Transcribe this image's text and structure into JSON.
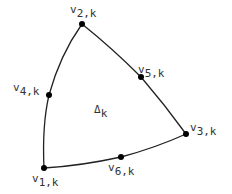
{
  "diagram": {
    "colors": {
      "stroke": "#222222",
      "text": "#333333",
      "background": "#ffffff"
    },
    "element_label": {
      "main": "Δ",
      "sub": "k"
    },
    "vertices": [
      {
        "id": "v1",
        "main": "v",
        "sub": "1,k",
        "x": 44,
        "y": 168
      },
      {
        "id": "v2",
        "main": "v",
        "sub": "2,k",
        "x": 82,
        "y": 24
      },
      {
        "id": "v3",
        "main": "v",
        "sub": "3,k",
        "x": 186,
        "y": 134
      },
      {
        "id": "v4",
        "main": "v",
        "sub": "4,k",
        "x": 49,
        "y": 95
      },
      {
        "id": "v5",
        "main": "v",
        "sub": "5,k",
        "x": 141,
        "y": 77
      },
      {
        "id": "v6",
        "main": "v",
        "sub": "6,k",
        "x": 121,
        "y": 157
      }
    ]
  }
}
